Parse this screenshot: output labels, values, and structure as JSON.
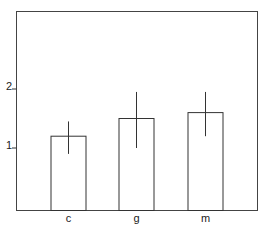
{
  "chart_data": {
    "type": "bar",
    "title": "",
    "xlabel": "",
    "ylabel": "",
    "categories": [
      "c",
      "g",
      "m"
    ],
    "values": [
      1.2,
      1.5,
      1.6
    ],
    "error_bars": [
      {
        "low": 0.9,
        "high": 1.45
      },
      {
        "low": 1.0,
        "high": 1.95
      },
      {
        "low": 1.2,
        "high": 1.95
      }
    ],
    "yticks": [
      1,
      2
    ],
    "ytick_labels": [
      "1",
      "2"
    ],
    "ylim": [
      0,
      3.3
    ],
    "grid": false,
    "legend": null,
    "bar_fill": "#ffffff",
    "line_color": "#333333"
  }
}
